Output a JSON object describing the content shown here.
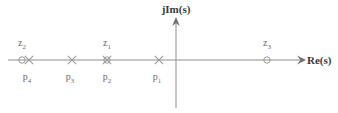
{
  "figure": {
    "title": "",
    "background_color": "#ffffff",
    "axis_color": "#8d8d8d",
    "marker_color": "#9a9a9a",
    "text_color": "#6b6b6b",
    "axis_label_color": "#3a3a3a"
  },
  "axes": {
    "real": {
      "label": "Re(s)",
      "label_x": 307,
      "label_y": 64,
      "line_y": 60,
      "line_x_start": 8,
      "line_x_end": 300,
      "arrow_tip_x": 302,
      "arrow_tip_y": 60
    },
    "imaginary": {
      "label": "jIm(s)",
      "label_x": 176,
      "label_y": 13,
      "line_x": 176,
      "line_y_start": 20,
      "line_y_end": 108,
      "arrow_tip_x": 176,
      "arrow_tip_y": 18
    }
  },
  "chart_data": {
    "type": "scatter",
    "title": "",
    "xlabel": "Re(s)",
    "ylabel": "jIm(s)",
    "subtitle": "Pole-zero plot on the complex s-plane",
    "grid": false,
    "legend": "none",
    "origin_px": {
      "x": 176,
      "y": 60
    },
    "series": [
      {
        "name": "zeros",
        "marker": "circle",
        "points": [
          {
            "id": "z2",
            "label": "z",
            "subscript": "2",
            "px": 22,
            "py": 60,
            "label_px": 22,
            "label_py": 46
          },
          {
            "id": "z1",
            "label": "z",
            "subscript": "1",
            "px": 107,
            "py": 60,
            "label_px": 107,
            "label_py": 46
          },
          {
            "id": "z3",
            "label": "z",
            "subscript": "3",
            "px": 267,
            "py": 60,
            "label_px": 267,
            "label_py": 46
          }
        ]
      },
      {
        "name": "poles",
        "marker": "cross",
        "points": [
          {
            "id": "p4",
            "label": "p",
            "subscript": "4",
            "px": 29,
            "py": 60,
            "label_px": 27,
            "label_py": 80
          },
          {
            "id": "p3",
            "label": "p",
            "subscript": "3",
            "px": 72,
            "py": 60,
            "label_px": 70,
            "label_py": 80
          },
          {
            "id": "p2",
            "label": "p",
            "subscript": "2",
            "px": 107,
            "py": 60,
            "label_px": 107,
            "label_py": 80
          },
          {
            "id": "p1",
            "label": "p",
            "subscript": "1",
            "px": 159,
            "py": 60,
            "label_px": 157,
            "label_py": 80
          }
        ]
      }
    ]
  }
}
